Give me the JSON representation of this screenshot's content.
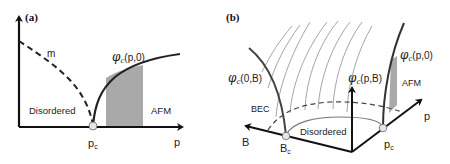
{
  "panel_a": {
    "label": "(a)",
    "curve_m_label": "m",
    "curve_phi_symbol": "φ",
    "curve_phi_sub": "c",
    "curve_phi_args": "(p,0)",
    "region_left": "Disordered",
    "region_right": "AFM",
    "x_axis_label": "p",
    "critical_point": "p",
    "critical_point_sub": "c"
  },
  "panel_b": {
    "label": "(b)",
    "curve_left_symbol": "φ",
    "curve_left_sub": "c",
    "curve_left_args": "(0,B)",
    "curve_center_symbol": "φ",
    "curve_center_sub": "c",
    "curve_center_args": "(p,B)",
    "curve_right_symbol": "φ",
    "curve_right_sub": "c",
    "curve_right_args": "(p,0)",
    "region_bec": "BEC",
    "region_disordered": "Disordered",
    "region_afm": "AFM",
    "axis_b_label": "B",
    "axis_p_label": "p",
    "critical_b": "B",
    "critical_b_sub": "c",
    "critical_p": "p",
    "critical_p_sub": "c"
  },
  "colors": {
    "line": "#222222",
    "shade": "#a9a9a9",
    "thin_line": "#9a9a9a",
    "point_fill": "#e6e6e6"
  }
}
